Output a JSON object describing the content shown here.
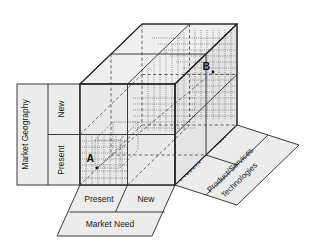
{
  "diagram": {
    "colors": {
      "panel_fill": "#ececec",
      "cube_fill": "#e9e9e9",
      "cube_top_fill": "#efefef",
      "line": "#3a3a3a",
      "line_dark": "#1a1a1a",
      "dotted": "#555555",
      "text": "#1a1a1a",
      "background": "#ffffff"
    }
  },
  "axes": {
    "left": {
      "name": "market-geography",
      "label": "Market Geography",
      "ticks": [
        {
          "label": "New"
        },
        {
          "label": "Present"
        }
      ]
    },
    "bottom": {
      "name": "market-need",
      "label": "Market Need",
      "ticks": [
        {
          "label": "Present"
        },
        {
          "label": "New"
        }
      ]
    },
    "right": {
      "name": "product-services-technologies",
      "label_line1": "Product/Services",
      "label_line2": "Technologies",
      "ticks": [
        {
          "label": "Present"
        },
        {
          "label": "New"
        }
      ]
    }
  },
  "points": [
    {
      "name": "point-a",
      "label": "A"
    },
    {
      "name": "point-b",
      "label": "B"
    }
  ]
}
